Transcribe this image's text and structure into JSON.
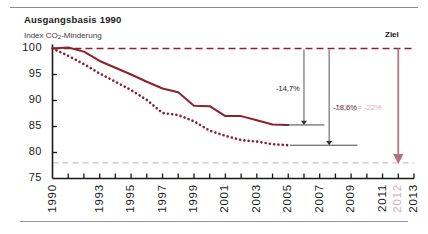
{
  "header": {
    "title": "Ausgangsbasis 1990",
    "subtitle_pre": "Index CO",
    "subtitle_sub": "2",
    "subtitle_post": "-Minderung",
    "target_label": "Ziel"
  },
  "colors": {
    "line_dark_red": "#8c2230",
    "baseline_dashed": "#8c2230",
    "target_dashed": "#e2b9c2",
    "target_arrow": "#b0727f",
    "annotation_pink": "#e0a8b4",
    "axis": "#1a1a1a",
    "text": "#1a1a1a",
    "rule": "#8d8d8d",
    "muted_tick": "#c8b4bb"
  },
  "chart_data": {
    "type": "line",
    "title": "Ausgangsbasis 1990",
    "subtitle": "Index CO2-Minderung",
    "xlabel": "",
    "ylabel": "Index CO2-Minderung",
    "ylim": [
      75,
      100
    ],
    "xlim": [
      1990,
      2013
    ],
    "yticks": [
      75,
      80,
      85,
      90,
      95,
      100
    ],
    "ytick_labels": [
      "75",
      "80",
      "85",
      "90",
      "95",
      "100"
    ],
    "xticks": [
      1990,
      1991,
      1992,
      1993,
      1994,
      1995,
      1996,
      1997,
      1998,
      1999,
      2000,
      2001,
      2002,
      2003,
      2004,
      2005,
      2006,
      2007,
      2008,
      2009,
      2010,
      2011,
      2012,
      2013
    ],
    "xtick_labels": [
      "1990",
      "1993",
      "1995",
      "1997",
      "1999",
      "2001",
      "2003",
      "2005",
      "2007",
      "2009",
      "2011",
      "2012",
      "2013"
    ],
    "xtick_label_years": [
      1990,
      1993,
      1995,
      1997,
      1999,
      2001,
      2003,
      2005,
      2007,
      2009,
      2011,
      2012,
      2013
    ],
    "xtick_label_muted": [
      false,
      false,
      false,
      false,
      false,
      false,
      false,
      false,
      false,
      false,
      false,
      true,
      false
    ],
    "grid": false,
    "legend": "none",
    "series": [
      {
        "name": "Index CO2-Minderung (durchgezogen)",
        "style": "solid",
        "color": "#8c2230",
        "x": [
          1990,
          1991,
          1992,
          1993,
          1994,
          1995,
          1996,
          1997,
          1998,
          1999,
          2000,
          2001,
          2002,
          2003,
          2004,
          2005
        ],
        "values": [
          100.0,
          100.2,
          99.4,
          97.6,
          96.3,
          95.0,
          93.6,
          92.3,
          91.6,
          89.0,
          88.9,
          87.0,
          87.0,
          86.2,
          85.4,
          85.3
        ]
      },
      {
        "name": "Index CO2-Minderung (gepunktet)",
        "style": "dotted",
        "color": "#8c2230",
        "x": [
          1990,
          1991,
          1992,
          1993,
          1994,
          1995,
          1996,
          1997,
          1998,
          1999,
          2000,
          2001,
          2002,
          2003,
          2004,
          2005
        ],
        "values": [
          100.0,
          98.6,
          97.0,
          95.2,
          93.6,
          92.0,
          90.1,
          87.6,
          87.2,
          86.0,
          84.2,
          83.2,
          82.4,
          82.1,
          81.6,
          81.4
        ]
      }
    ],
    "reference_lines": [
      {
        "name": "baseline-1990",
        "y": 100,
        "style": "dashed",
        "color": "#8c2230"
      },
      {
        "name": "target-2012",
        "y": 78,
        "style": "dashed",
        "color": "#e2b9c2"
      }
    ],
    "annotations": [
      {
        "name": "reduction-solid",
        "text": "-14,7%",
        "from_y": 100,
        "to_y": 85.3,
        "at_x": 2006
      },
      {
        "name": "reduction-dotted",
        "text": "-18,6%",
        "from_y": 100,
        "to_y": 81.4,
        "at_x": 2007.6
      },
      {
        "name": "target-reduction",
        "text": "ΔCO₂ = -22%",
        "from_y": 100,
        "to_y": 78,
        "at_x": 2012
      }
    ]
  },
  "annotations": {
    "solid_drop": "-14,7%",
    "dotted_drop": "-18,6%",
    "target_pre": "ΔCO",
    "target_sub": "2",
    "target_post": " = -22%"
  }
}
